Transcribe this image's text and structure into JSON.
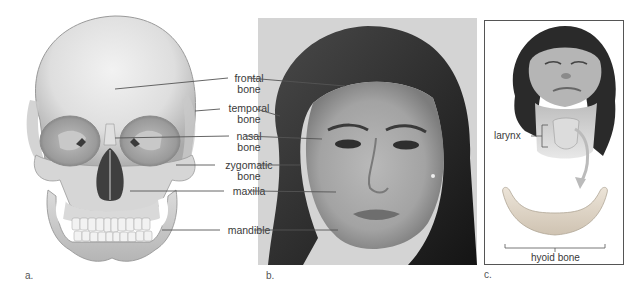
{
  "panels": {
    "a": {
      "label": "a.",
      "subject": "anterior view of human skull",
      "bone_labels": [
        {
          "id": "frontal",
          "line1": "frontal",
          "line2": "bone"
        },
        {
          "id": "temporal",
          "line1": "temporal",
          "line2": "bone"
        },
        {
          "id": "nasal",
          "line1": "nasal",
          "line2": "bone"
        },
        {
          "id": "zygomatic",
          "line1": "zygomatic",
          "line2": "bone"
        },
        {
          "id": "maxilla",
          "line1": "maxilla",
          "line2": ""
        },
        {
          "id": "mandible",
          "line1": "mandible",
          "line2": ""
        }
      ]
    },
    "b": {
      "label": "b.",
      "subject": "photograph of woman's face with corresponding bone locations"
    },
    "c": {
      "label": "c.",
      "subject": "woman with head tilted back showing neck, and isolated hyoid bone",
      "larynx_label": "larynx",
      "hyoid_label": "hyoid bone"
    }
  },
  "colors": {
    "bone_light": "#ececec",
    "bone_mid": "#cfcfcf",
    "bone_shadow": "#9a9a9a",
    "cavity_dark": "#3a3a3a",
    "hyoid_tint": "#e6ddd0",
    "leader_line": "#555555",
    "text": "#3a3a3a"
  }
}
